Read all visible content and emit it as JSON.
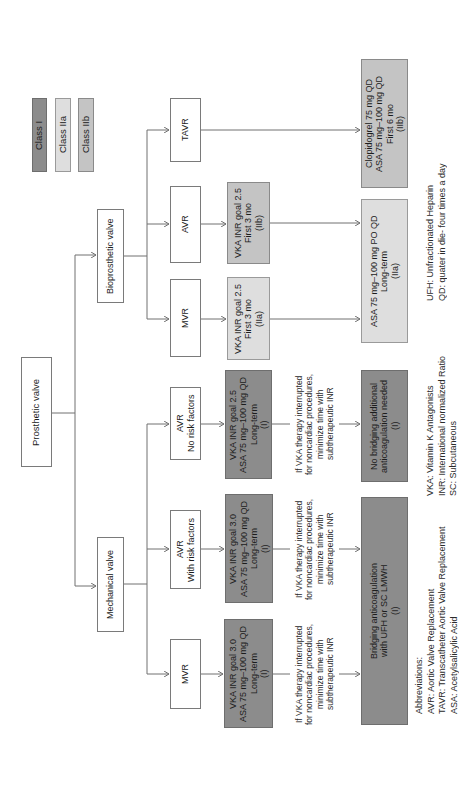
{
  "legend": [
    {
      "label": "Class I",
      "color": "#8c8c8c"
    },
    {
      "label": "Class IIa",
      "color": "#dedede"
    },
    {
      "label": "Class IIb",
      "color": "#c4c4c4"
    }
  ],
  "nodes": {
    "prosthetic_valve": {
      "lines": [
        "Prosthetic valve"
      ]
    },
    "bioprosthetic_valve": {
      "lines": [
        "Bioprosthetic valve"
      ]
    },
    "mechanical_valve": {
      "lines": [
        "Mechanical valve"
      ]
    },
    "bio_tavr": {
      "lines": [
        "TAVR"
      ]
    },
    "bio_avr": {
      "lines": [
        "AVR"
      ]
    },
    "bio_mvr": {
      "lines": [
        "MVR"
      ]
    },
    "mech_avr_norisk": {
      "lines": [
        "AVR",
        "No risk factors"
      ]
    },
    "mech_avr_risk": {
      "lines": [
        "AVR",
        "With risk factors"
      ]
    },
    "mech_mvr": {
      "lines": [
        "MVR"
      ]
    },
    "bio_rx_avr": {
      "lines": [
        "VKA INR goal 2.5",
        "First 3 mo",
        "(IIb)"
      ],
      "class": "IIb"
    },
    "bio_rx_mvr": {
      "lines": [
        "VKA INR goal 2.5",
        "First 3 mo",
        "(IIa)"
      ],
      "class": "IIa"
    },
    "mech_rx_norisk": {
      "lines": [
        "VKA INR goal 2.5",
        "ASA 75 mg–100 mg QD",
        "Long-term",
        "(I)"
      ],
      "class": "I"
    },
    "mech_rx_risk": {
      "lines": [
        "VKA INR goal 3.0",
        "ASA 75 mg–100 mg QD",
        "Long-term",
        "(I)"
      ],
      "class": "I"
    },
    "mech_rx_mvr": {
      "lines": [
        "VKA INR goal 3.0",
        "ASA 75 mg–100 mg QD",
        "Long-term",
        "(I)"
      ],
      "class": "I"
    },
    "clopidogrel": {
      "lines": [
        "Clopidogrel 75 mg  QD",
        "ASA 75 mg–100 mg QD",
        "First 6 mo",
        "(IIb)"
      ],
      "class": "IIb"
    },
    "asa_longterm": {
      "lines": [
        "ASA 75 mg–100 mg PO QD",
        "Long-term",
        "(IIa)"
      ],
      "class": "IIa"
    },
    "no_bridging": {
      "lines": [
        "No bridging additional",
        "anticoagulation needed",
        "(I)"
      ],
      "class": "I"
    },
    "bridging": {
      "lines": [
        "Bridging anticoagulation",
        "with UFH or SC LMWH",
        "(I)"
      ],
      "class": "I"
    }
  },
  "note": {
    "lines": [
      "If VKA therapy interrupted",
      "for noncardiac procedures,",
      "minimize time with",
      "subtherapeutic INR"
    ]
  },
  "abbreviations": {
    "col1": [
      "Abbreviations:",
      "AVR: Aortic Valve Replacement",
      "TAVR: Transcatheter Aortic Valve Replacement",
      "ASA: Acetylsalicylic Acid"
    ],
    "col2": [
      "VKA: Vitamin K Antagonists",
      "INR: International normalized Ratio",
      "SC: Subcutaneous"
    ],
    "col3": [
      "UFH: Unfractionated Heparin",
      "QD: quater in die- four times a day"
    ]
  }
}
